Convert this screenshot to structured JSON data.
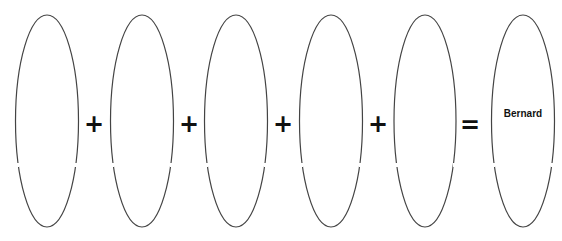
{
  "diagram": {
    "type": "equation-of-ovals",
    "stroke_color": "#444444",
    "ovals": [
      {
        "id": 1,
        "label": ""
      },
      {
        "id": 2,
        "label": ""
      },
      {
        "id": 3,
        "label": ""
      },
      {
        "id": 4,
        "label": ""
      },
      {
        "id": 5,
        "label": ""
      },
      {
        "id": 6,
        "label": "Bernard"
      }
    ],
    "operators": [
      "+",
      "+",
      "+",
      "+",
      "="
    ]
  }
}
